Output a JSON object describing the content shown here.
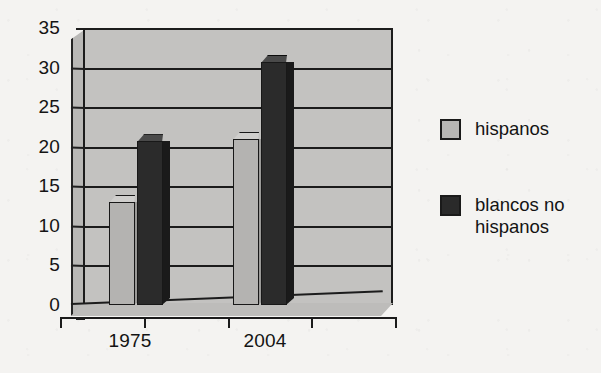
{
  "chart_data": {
    "type": "bar",
    "title": "",
    "subtitle": "",
    "xlabel": "",
    "ylabel": "",
    "categories": [
      "1975",
      "2004"
    ],
    "series": [
      {
        "name": "hispanos",
        "color": "#b4b3b1",
        "values": [
          13,
          21
        ]
      },
      {
        "name": "blancos no hispanos",
        "color": "#2b2b2b",
        "values": [
          20.7,
          30.7
        ]
      }
    ],
    "ylim": [
      0,
      35
    ],
    "ytick_values": [
      35,
      30,
      25,
      20,
      15,
      10,
      5,
      0
    ],
    "ytick_labels": [
      "35",
      "30",
      "25",
      "20",
      "15",
      "10",
      "5",
      "0"
    ],
    "grid": true,
    "grid_axis": "y",
    "legend_position": "right",
    "style": "3d-bar",
    "background_color": "#f4f3f1",
    "plot_area_color": "#c3c2c0",
    "axis_color": "#1b1b1b"
  },
  "legend": {
    "entries": [
      {
        "label": "hispanos",
        "swatch": "light"
      },
      {
        "label": "blancos no hispanos",
        "swatch": "dark"
      }
    ]
  },
  "axes": {
    "x": {
      "tick_labels": [
        "1975",
        "2004"
      ]
    },
    "y": {
      "tick_labels": [
        "35",
        "30",
        "25",
        "20",
        "15",
        "10",
        "5",
        "0"
      ]
    }
  }
}
